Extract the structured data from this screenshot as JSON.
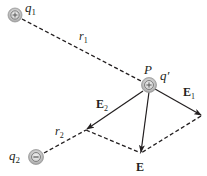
{
  "diagram": {
    "charges": [
      {
        "id": "q1",
        "label": "q",
        "subscript": "1",
        "sign": "+",
        "x": 15,
        "y": 15
      },
      {
        "id": "q2",
        "label": "q",
        "subscript": "2",
        "sign": "−",
        "x": 36,
        "y": 157
      },
      {
        "id": "q_prime",
        "label": "q′",
        "sign": "+",
        "x": 149,
        "y": 85
      }
    ],
    "point": {
      "label": "P"
    },
    "distances": [
      {
        "label": "r",
        "subscript": "1"
      },
      {
        "label": "r",
        "subscript": "2"
      }
    ],
    "vectors": [
      {
        "id": "E1",
        "label": "E",
        "subscript": "1"
      },
      {
        "id": "E2",
        "label": "E",
        "subscript": "2"
      },
      {
        "id": "E",
        "label": "E",
        "subscript": ""
      }
    ],
    "colors": {
      "line": "#231f20",
      "charge_fill": "#c8c8c8",
      "charge_edge": "#9a9a9a",
      "sign": "#5a5a5a"
    }
  }
}
